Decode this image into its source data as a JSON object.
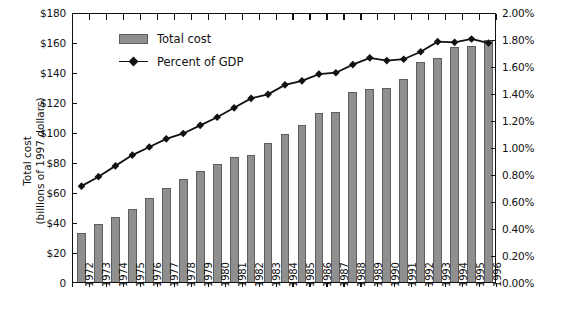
{
  "chart_data": {
    "type": "bar",
    "title": "",
    "subtitle": "",
    "xlabel": "",
    "ylabel": "Total cost\n(billions of 1997 dollars)",
    "y2label": "Percent of GDP",
    "grid": false,
    "legend_position": "top-left",
    "categories": [
      "1972",
      "1973",
      "1974",
      "1975",
      "1976",
      "1977",
      "1978",
      "1979",
      "1980",
      "1981",
      "1982",
      "1983",
      "1984",
      "1985",
      "1986",
      "1987",
      "1988",
      "1989",
      "1990",
      "1991",
      "1992",
      "1993",
      "1994",
      "1995",
      "1996"
    ],
    "ylim": [
      0,
      180
    ],
    "yticks": [
      0,
      20,
      40,
      60,
      80,
      100,
      120,
      140,
      160,
      180
    ],
    "ytick_labels": [
      "0",
      "$20",
      "$40",
      "$60",
      "$80",
      "$100",
      "$120",
      "$140",
      "$160",
      "$180"
    ],
    "y2lim": [
      0,
      2.0
    ],
    "y2ticks": [
      0,
      0.2,
      0.4,
      0.6,
      0.8,
      1.0,
      1.2,
      1.4,
      1.6,
      1.8,
      2.0
    ],
    "y2tick_labels": [
      "0.00%",
      "0.20%",
      "0.40%",
      "0.60%",
      "0.80%",
      "1.00%",
      "1.20%",
      "1.40%",
      "1.60%",
      "1.80%",
      "2.00%"
    ],
    "series": [
      {
        "name": "Total cost",
        "type": "bar",
        "axis": "left",
        "units": "billions of 1997 dollars",
        "color": "#8f8f8f",
        "values": [
          32.5,
          38.8,
          43.2,
          48.8,
          55.8,
          62.8,
          68.6,
          74.2,
          78.8,
          83.2,
          84.5,
          92.5,
          98.8,
          105.0,
          113.0,
          113.5,
          126.5,
          128.5,
          129.5,
          135.5,
          147.0,
          149.5,
          156.5,
          157.5,
          161.5
        ]
      },
      {
        "name": "Percent of GDP",
        "type": "line",
        "axis": "right",
        "units": "percent",
        "color": "#111111",
        "marker": "diamond",
        "values": [
          0.725,
          0.795,
          0.875,
          0.955,
          1.015,
          1.075,
          1.115,
          1.175,
          1.235,
          1.305,
          1.375,
          1.405,
          1.475,
          1.505,
          1.555,
          1.565,
          1.625,
          1.675,
          1.655,
          1.665,
          1.72,
          1.795,
          1.79,
          1.815,
          1.785
        ]
      }
    ],
    "legend": [
      {
        "label": "Total cost",
        "marker": "bar-swatch"
      },
      {
        "label": "Percent of GDP",
        "marker": "line-diamond"
      }
    ]
  },
  "axes": {
    "left_title_line1": "Total cost",
    "left_title_line2": "(billions of 1997 dollars)",
    "right_title": "Percent of GDP"
  },
  "colors": {
    "bar_fill": "#8f8f8f",
    "bar_edge": "#5e5e5e",
    "line": "#111111",
    "frame": "#111111",
    "background": "#ffffff"
  }
}
